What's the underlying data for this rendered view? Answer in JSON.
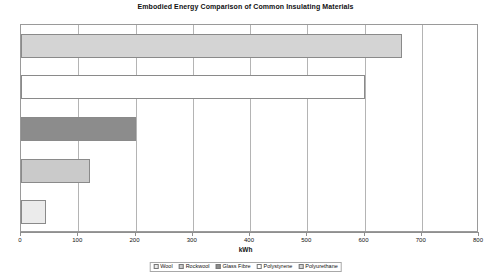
{
  "chart_data": {
    "type": "bar",
    "orientation": "horizontal",
    "title": "Embodied Energy Comparison of Common Insulating Materials",
    "xlabel": "kWh",
    "ylabel": "",
    "xlim": [
      0,
      800
    ],
    "xticks": [
      0,
      100,
      200,
      300,
      400,
      500,
      600,
      700,
      800
    ],
    "xtick_labels": [
      "0",
      "100",
      "200",
      "300",
      "400",
      "500",
      "600",
      "700",
      "800"
    ],
    "grid": true,
    "grid_axis": "x",
    "legend_position": "bottom",
    "categories": [
      "Polyurethane",
      "Polystyrene",
      "Glass Fibre",
      "Rockwool",
      "Wool"
    ],
    "values": [
      665,
      600,
      200,
      120,
      44
    ],
    "series": [
      {
        "name": "Polyurethane",
        "value": 665,
        "color": "#d4d4d4"
      },
      {
        "name": "Polystyrene",
        "value": 600,
        "color": "#ffffff"
      },
      {
        "name": "Glass Fibre",
        "value": 200,
        "color": "#8c8c8c"
      },
      {
        "name": "Rockwool",
        "value": 120,
        "color": "#cacaca"
      },
      {
        "name": "Wool",
        "value": 44,
        "color": "#ebebeb"
      }
    ]
  },
  "legend": {
    "items": [
      {
        "label": "Wool",
        "color": "#ebebeb"
      },
      {
        "label": "Rockwool",
        "color": "#cacaca"
      },
      {
        "label": "Glass Fibre",
        "color": "#8c8c8c"
      },
      {
        "label": "Polystyrene",
        "color": "#ffffff"
      },
      {
        "label": "Polyurethane",
        "color": "#d4d4d4"
      }
    ]
  }
}
